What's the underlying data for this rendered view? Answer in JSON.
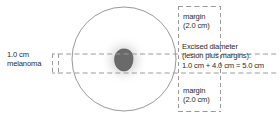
{
  "figure": {
    "type": "medical-diagram",
    "colors": {
      "lesion_fill": "#6a6a6a",
      "lesion_stroke": "#565656",
      "halo": "#b9b9b9",
      "circle_stroke": "#8d8d8d",
      "dashed_stroke": "#9a9a9a",
      "text": "#2b2b2b",
      "background": "#ffffff"
    },
    "lesion": {
      "label_line1": "1.0 cm",
      "label_line2": "melanoma",
      "diameter_cm": 1.0
    },
    "margin_top": {
      "label_line1": "margin",
      "label_line2": "(2.0 cm)",
      "value_cm": 2.0
    },
    "margin_bottom": {
      "label_line1": "margin",
      "label_line2": "(2.0 cm)",
      "value_cm": 2.0
    },
    "excised": {
      "label_line1": "Excised diameter",
      "label_line2": "(lesion plus margins):",
      "label_line3": "1.0 cm + 4.0 cm = 5.0 cm",
      "lesion_cm": 1.0,
      "margins_total_cm": 4.0,
      "total_cm": 5.0
    },
    "geometry": {
      "circle_center_x": 124,
      "circle_center_y": 59,
      "circle_radius": 52,
      "band_left": 58,
      "band_right": 278,
      "band_top": 54,
      "band_bottom": 73,
      "box_left": 178,
      "box_right": 221,
      "box_top": 6,
      "box_bottom": 112
    }
  }
}
